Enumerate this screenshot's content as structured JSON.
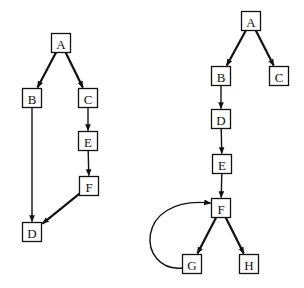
{
  "diagram": {
    "type": "directed-graphs",
    "graphs": [
      {
        "id": "left-graph",
        "nodes": [
          {
            "id": "A",
            "label": "A",
            "cx": 61,
            "cy": 43
          },
          {
            "id": "B",
            "label": "B",
            "cx": 32,
            "cy": 98
          },
          {
            "id": "C",
            "label": "C",
            "cx": 88,
            "cy": 98
          },
          {
            "id": "E",
            "label": "E",
            "cx": 88,
            "cy": 141
          },
          {
            "id": "F",
            "label": "F",
            "cx": 89,
            "cy": 186
          },
          {
            "id": "D",
            "label": "D",
            "cx": 32,
            "cy": 232
          }
        ],
        "edges": [
          {
            "from": "A",
            "to": "B",
            "bold": true
          },
          {
            "from": "A",
            "to": "C",
            "bold": true
          },
          {
            "from": "C",
            "to": "E",
            "bold": false
          },
          {
            "from": "E",
            "to": "F",
            "bold": false
          },
          {
            "from": "B",
            "to": "D",
            "bold": false
          },
          {
            "from": "F",
            "to": "D",
            "bold": true
          }
        ]
      },
      {
        "id": "right-graph",
        "nodes": [
          {
            "id": "A",
            "label": "A",
            "cx": 251,
            "cy": 21
          },
          {
            "id": "B",
            "label": "B",
            "cx": 221,
            "cy": 76
          },
          {
            "id": "C",
            "label": "C",
            "cx": 279,
            "cy": 76
          },
          {
            "id": "D",
            "label": "D",
            "cx": 221,
            "cy": 119
          },
          {
            "id": "E",
            "label": "E",
            "cx": 222,
            "cy": 164
          },
          {
            "id": "F",
            "label": "F",
            "cx": 221,
            "cy": 208
          },
          {
            "id": "G",
            "label": "G",
            "cx": 192,
            "cy": 264
          },
          {
            "id": "H",
            "label": "H",
            "cx": 249,
            "cy": 264
          }
        ],
        "edges": [
          {
            "from": "A",
            "to": "B",
            "bold": true
          },
          {
            "from": "A",
            "to": "C",
            "bold": true
          },
          {
            "from": "B",
            "to": "D",
            "bold": false
          },
          {
            "from": "D",
            "to": "E",
            "bold": false
          },
          {
            "from": "E",
            "to": "F",
            "bold": false
          },
          {
            "from": "F",
            "to": "G",
            "bold": true
          },
          {
            "from": "F",
            "to": "H",
            "bold": true
          },
          {
            "from": "G",
            "to": "F",
            "bold": false,
            "curved": true
          }
        ]
      }
    ],
    "node_size": 19,
    "colors": {
      "stroke": "#111111",
      "background": "#ffffff"
    }
  }
}
